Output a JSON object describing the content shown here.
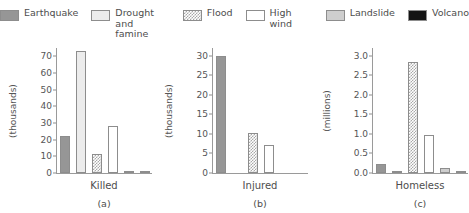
{
  "legend": {
    "items": [
      {
        "label": "Earthquake",
        "key": "earthquake",
        "color": "#969696"
      },
      {
        "label": "Drought and\nfamine",
        "key": "drought",
        "color": "#ececec"
      },
      {
        "label": "Flood",
        "key": "flood",
        "color": "#a8a8a8"
      },
      {
        "label": "High wind",
        "key": "highwind",
        "color": "#ffffff"
      },
      {
        "label": "Landslide",
        "key": "landslide",
        "color": "#cecece"
      },
      {
        "label": "Volcano",
        "key": "volcano",
        "color": "#141414"
      }
    ]
  },
  "chart_data": {
    "type": "bar",
    "title": "",
    "categories": [
      "Earthquake",
      "Drought and famine",
      "Flood",
      "High wind",
      "Landslide",
      "Volcano"
    ],
    "grid": false,
    "legend_position": "top",
    "panels": [
      {
        "caption": "(a)",
        "group_label": "Killed",
        "ylabel": "(thousands)",
        "ylim": [
          0,
          75
        ],
        "yticks": [
          0,
          10,
          20,
          30,
          40,
          50,
          60,
          70
        ],
        "ytick_labels": [
          "0",
          "10",
          "20",
          "30",
          "40",
          "50",
          "60",
          "70"
        ],
        "values": [
          22.5,
          73.0,
          11.5,
          28.0,
          1.5,
          1.0
        ]
      },
      {
        "caption": "(b)",
        "group_label": "Injured",
        "ylabel": "(thousands)",
        "ylim": [
          0,
          32
        ],
        "yticks": [
          0,
          5,
          10,
          15,
          20,
          25,
          30
        ],
        "ytick_labels": [
          "0",
          "5",
          "10",
          "15",
          "20",
          "25",
          "30"
        ],
        "values": [
          30.0,
          0,
          10.3,
          7.1,
          0,
          0
        ]
      },
      {
        "caption": "(c)",
        "group_label": "Homeless",
        "ylabel": "(millions)",
        "ylim": [
          0,
          3.2
        ],
        "yticks": [
          0,
          0.5,
          1.0,
          1.5,
          2.0,
          2.5,
          3.0
        ],
        "ytick_labels": [
          "0.0",
          "0.5",
          "1.0",
          "1.5",
          "2.0",
          "2.5",
          "3.0"
        ],
        "values": [
          0.22,
          0.05,
          2.85,
          0.98,
          0.12,
          0.05
        ]
      }
    ]
  }
}
